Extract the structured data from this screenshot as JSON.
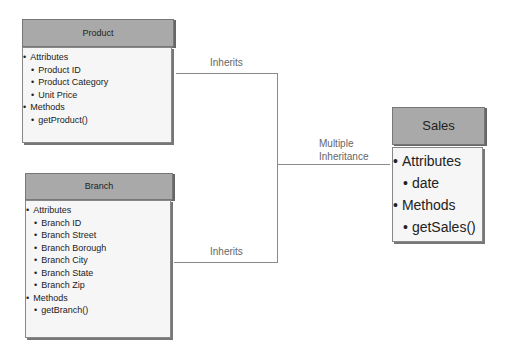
{
  "diagram": {
    "classes": [
      {
        "name": "Product",
        "sections": [
          {
            "label": "Attributes",
            "items": [
              "Product ID",
              "Product Category",
              "Unit Price"
            ]
          },
          {
            "label": "Methods",
            "items": [
              "getProduct()"
            ]
          }
        ]
      },
      {
        "name": "Branch",
        "sections": [
          {
            "label": "Attributes",
            "items": [
              "Branch ID",
              "Branch Street",
              "Branch Borough",
              "Branch City",
              "Branch State",
              "Branch Zip"
            ]
          },
          {
            "label": "Methods",
            "items": [
              "getBranch()"
            ]
          }
        ]
      },
      {
        "name": "Sales",
        "sections": [
          {
            "label": "Attributes",
            "items": [
              "date"
            ]
          },
          {
            "label": "Methods",
            "items": [
              "getSales()"
            ]
          }
        ]
      }
    ],
    "connectors": {
      "top_label": "Inherits",
      "bottom_label": "Inherits",
      "middle_label_line1": "Multiple",
      "middle_label_line2": "Inheritance"
    },
    "colors": {
      "header_fill": "#a9a9a9",
      "body_fill": "#f6f6f6",
      "line": "#8a8a8a",
      "label_text": "#666666"
    }
  }
}
